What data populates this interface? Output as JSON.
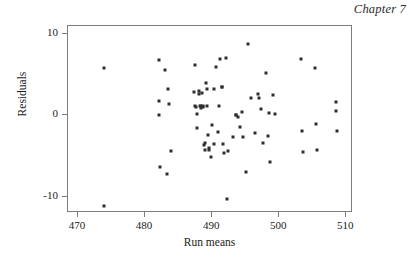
{
  "page": {
    "running_head": "Chapter 7"
  },
  "chart_data": {
    "type": "scatter",
    "title": "",
    "xlabel": "Run means",
    "ylabel": "Residuals",
    "xlim": [
      468.5,
      511.0
    ],
    "ylim": [
      -12.0,
      11.0
    ],
    "grid": false,
    "legend": null,
    "xticks": [
      470,
      480,
      490,
      500,
      510
    ],
    "xticklabels": [
      "470",
      "480",
      "490",
      "500",
      "510"
    ],
    "yticks": [
      10,
      0,
      -10
    ],
    "yticklabels": [
      "10",
      "0",
      "-10"
    ],
    "marker": "square",
    "marker_color": "#2e2e2e",
    "marker_size_px": 3,
    "n_points": 88,
    "points": [
      [
        473.8,
        5.8
      ],
      [
        473.8,
        -11.1
      ],
      [
        482.1,
        6.8
      ],
      [
        482.1,
        1.8
      ],
      [
        482.1,
        0.0
      ],
      [
        482.2,
        -6.4
      ],
      [
        483.0,
        5.6
      ],
      [
        483.2,
        -7.2
      ],
      [
        483.4,
        3.2
      ],
      [
        483.5,
        1.4
      ],
      [
        483.9,
        -4.4
      ],
      [
        487.3,
        2.9
      ],
      [
        487.4,
        6.2
      ],
      [
        487.5,
        1.2
      ],
      [
        487.6,
        1.0
      ],
      [
        487.7,
        0.2
      ],
      [
        487.8,
        -1.6
      ],
      [
        488.0,
        2.6
      ],
      [
        488.1,
        3.0
      ],
      [
        488.2,
        1.2
      ],
      [
        488.3,
        1.1
      ],
      [
        488.4,
        0.9
      ],
      [
        488.5,
        2.7
      ],
      [
        488.6,
        1.2
      ],
      [
        488.7,
        1.0
      ],
      [
        488.8,
        -3.6
      ],
      [
        488.9,
        -4.2
      ],
      [
        489.0,
        -3.4
      ],
      [
        489.1,
        4.0
      ],
      [
        489.2,
        3.2
      ],
      [
        489.3,
        1.1
      ],
      [
        489.4,
        -2.4
      ],
      [
        489.5,
        -4.0
      ],
      [
        489.6,
        -4.2
      ],
      [
        489.8,
        -5.1
      ],
      [
        489.9,
        -1.2
      ],
      [
        490.2,
        3.2
      ],
      [
        490.3,
        -3.5
      ],
      [
        490.6,
        5.9
      ],
      [
        490.8,
        -2.0
      ],
      [
        491.0,
        1.2
      ],
      [
        491.2,
        6.9
      ],
      [
        491.4,
        3.5
      ],
      [
        491.5,
        3.5
      ],
      [
        491.6,
        -3.5
      ],
      [
        491.8,
        -4.6
      ],
      [
        492.0,
        7.1
      ],
      [
        492.2,
        -10.3
      ],
      [
        492.4,
        -4.4
      ],
      [
        493.1,
        -2.6
      ],
      [
        493.5,
        0.1
      ],
      [
        493.6,
        0.0
      ],
      [
        493.8,
        -0.2
      ],
      [
        494.2,
        -1.4
      ],
      [
        494.4,
        0.4
      ],
      [
        494.6,
        -2.7
      ],
      [
        495.1,
        -6.9
      ],
      [
        495.4,
        8.8
      ],
      [
        495.8,
        2.2
      ],
      [
        496.4,
        -2.1
      ],
      [
        496.9,
        2.6
      ],
      [
        497.0,
        2.2
      ],
      [
        497.3,
        0.8
      ],
      [
        497.6,
        -3.4
      ],
      [
        498.0,
        5.2
      ],
      [
        498.3,
        -2.5
      ],
      [
        498.4,
        0.3
      ],
      [
        498.6,
        -5.7
      ],
      [
        499.1,
        2.5
      ],
      [
        499.3,
        0.2
      ],
      [
        503.2,
        6.9
      ],
      [
        503.4,
        -1.9
      ],
      [
        503.6,
        -4.5
      ],
      [
        505.3,
        5.8
      ],
      [
        505.5,
        -1.1
      ],
      [
        505.6,
        -4.3
      ],
      [
        508.4,
        1.7
      ],
      [
        508.5,
        0.6
      ],
      [
        508.6,
        -1.9
      ]
    ]
  }
}
